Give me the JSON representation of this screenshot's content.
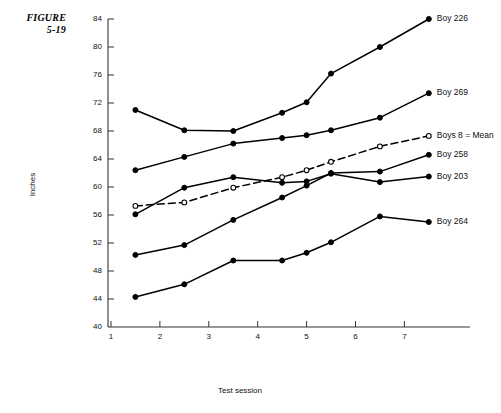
{
  "figure": {
    "caption_line1": "FIGURE",
    "caption_line2": "5-19"
  },
  "chart_data": {
    "type": "line",
    "title": "",
    "xlabel": "Test session",
    "ylabel": "Inches",
    "xlim": [
      0.6,
      8.2
    ],
    "ylim": [
      40,
      84
    ],
    "grid": false,
    "legend_position": "right-inline-labels",
    "x_ticks": [
      1,
      2,
      3,
      4,
      5,
      6,
      7
    ],
    "y_ticks": [
      40,
      44,
      48,
      52,
      56,
      60,
      64,
      68,
      72,
      76,
      80,
      84
    ],
    "x": [
      1.5,
      2.5,
      3.5,
      4.5,
      5.0,
      5.5,
      6.5,
      7.5
    ],
    "series": [
      {
        "name": "Boy 226",
        "label": "Boy 226",
        "marker": "filled-circle",
        "line": "solid",
        "x": [
          1.5,
          2.5,
          3.5,
          4.5,
          5.0,
          5.5,
          6.5,
          7.5
        ],
        "values": [
          71.0,
          68.1,
          68.0,
          70.6,
          72.1,
          76.2,
          80.0,
          84.0
        ]
      },
      {
        "name": "Boy 269",
        "label": "Boy 269",
        "marker": "filled-circle",
        "line": "solid",
        "x": [
          1.5,
          2.5,
          3.5,
          4.5,
          5.0,
          5.5,
          6.5,
          7.5
        ],
        "values": [
          62.4,
          64.3,
          66.2,
          67.0,
          67.4,
          68.1,
          69.9,
          73.4
        ]
      },
      {
        "name": "Boys 8 = Mean",
        "label": "Boys 8 = Mean",
        "marker": "open-circle",
        "line": "dashed",
        "x": [
          1.5,
          2.5,
          3.5,
          4.5,
          5.0,
          5.5,
          6.5,
          7.5
        ],
        "values": [
          57.3,
          57.8,
          59.9,
          61.4,
          62.4,
          63.6,
          65.8,
          67.3
        ]
      },
      {
        "name": "Boy 258",
        "label": "Boy 258",
        "marker": "filled-circle",
        "line": "solid",
        "x": [
          1.5,
          2.5,
          3.5,
          4.5,
          5.0,
          5.5,
          6.5,
          7.5
        ],
        "values": [
          50.3,
          51.7,
          55.3,
          58.5,
          60.2,
          62.0,
          62.2,
          64.6
        ]
      },
      {
        "name": "Boy 203",
        "label": "Boy 203",
        "marker": "filled-circle",
        "line": "solid",
        "x": [
          1.5,
          2.5,
          3.5,
          4.5,
          5.0,
          5.5,
          6.5,
          7.5
        ],
        "values": [
          56.1,
          59.9,
          61.4,
          60.6,
          60.8,
          61.9,
          60.7,
          61.5
        ]
      },
      {
        "name": "Boy 264",
        "label": "Boy 264",
        "marker": "filled-circle",
        "line": "solid",
        "x": [
          1.5,
          2.5,
          3.5,
          4.5,
          5.0,
          5.5,
          6.5,
          7.5
        ],
        "values": [
          44.3,
          46.1,
          49.5,
          49.5,
          50.6,
          52.1,
          55.8,
          55.0
        ]
      }
    ],
    "colors": {
      "line": "#000000",
      "marker_fill": "#000000",
      "marker_open_fill": "#ffffff",
      "axis": "#333333",
      "background": "#ffffff"
    }
  }
}
